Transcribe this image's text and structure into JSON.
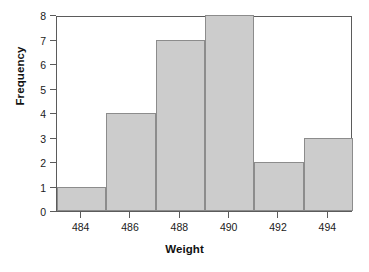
{
  "chart_data": {
    "type": "bar",
    "title": "",
    "subtitle": "",
    "xlabel": "Weight",
    "ylabel": "Frequency",
    "grid": false,
    "legend": false,
    "legend_position": "none",
    "bar_style": {
      "fill_color": "#cccccc",
      "edge_color": "#8c8c8c",
      "frame_color": "#5b5b5b",
      "background": "#ffffff"
    },
    "xlim": [
      483,
      495
    ],
    "ylim": [
      0,
      8
    ],
    "bin_width": 2,
    "xtick_labels": [
      "484",
      "486",
      "488",
      "490",
      "492",
      "494"
    ],
    "xticks": [
      484,
      486,
      488,
      490,
      492,
      494
    ],
    "ytick_labels": [
      "0",
      "1",
      "2",
      "3",
      "4",
      "5",
      "6",
      "7",
      "8"
    ],
    "yticks": [
      0,
      1,
      2,
      3,
      4,
      5,
      6,
      7,
      8
    ],
    "categories": [
      "483-485",
      "485-487",
      "487-489",
      "489-491",
      "491-493",
      "493-495"
    ],
    "bin_edges": [
      483,
      485,
      487,
      489,
      491,
      493,
      495
    ],
    "values": [
      1,
      4,
      7,
      8,
      2,
      3
    ],
    "bars": [
      {
        "label": "483-485",
        "left": 483,
        "right": 485,
        "value": 1
      },
      {
        "label": "485-487",
        "left": 485,
        "right": 487,
        "value": 4
      },
      {
        "label": "487-489",
        "left": 487,
        "right": 489,
        "value": 7
      },
      {
        "label": "489-491",
        "left": 489,
        "right": 491,
        "value": 8
      },
      {
        "label": "491-493",
        "left": 491,
        "right": 493,
        "value": 2
      },
      {
        "label": "493-495",
        "left": 493,
        "right": 495,
        "value": 3
      }
    ]
  }
}
